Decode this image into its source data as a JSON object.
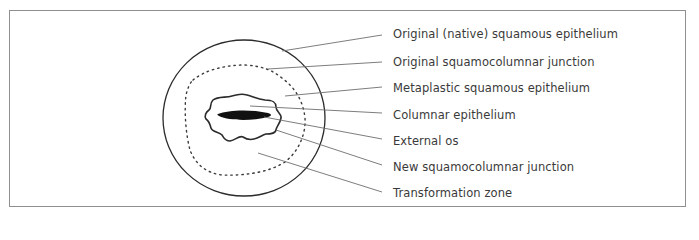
{
  "figure": {
    "colors": {
      "outline": "#2b2b2b",
      "leader": "#6e6e6e",
      "frame": "#8f8f8f",
      "os_fill": "#111111",
      "text": "#3a3a3a"
    },
    "labels": [
      {
        "id": "original-squamous-epithelium",
        "text": "Original (native) squamous epithelium"
      },
      {
        "id": "original-scj",
        "text": "Original squamocolumnar junction"
      },
      {
        "id": "metaplastic-squamous-epithelium",
        "text": "Metaplastic squamous epithelium"
      },
      {
        "id": "columnar-epithelium",
        "text": "Columnar epithelium"
      },
      {
        "id": "external-os",
        "text": "External os"
      },
      {
        "id": "new-scj",
        "text": "New squamocolumnar junction"
      },
      {
        "id": "transformation-zone",
        "text": "Transformation zone"
      }
    ]
  }
}
